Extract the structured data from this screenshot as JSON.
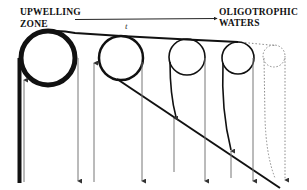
{
  "diagram": {
    "left_label": {
      "line1": "UPWELLING",
      "line2": "ZONE"
    },
    "right_label": {
      "line1": "OLIGOTROPHIC",
      "line2": "WATERS"
    },
    "time_label": "t",
    "colors": {
      "ink": "#111111",
      "flux_arrow": "#777777",
      "dotted": "#888888",
      "background": "#ffffff"
    },
    "circles": [
      {
        "id": "eddy-1",
        "cx": 48,
        "cy": 58,
        "r": 27,
        "stroke_width": 5
      },
      {
        "id": "eddy-2",
        "cx": 121,
        "cy": 58,
        "r": 22,
        "stroke_width": 2.5
      },
      {
        "id": "eddy-3",
        "cx": 187,
        "cy": 57,
        "r": 18,
        "stroke_width": 1.6
      },
      {
        "id": "eddy-4",
        "cx": 238,
        "cy": 58,
        "r": 16,
        "stroke_width": 1.6
      },
      {
        "id": "eddy-5-dotted",
        "cx": 274,
        "cy": 57,
        "r": 11,
        "dotted": true
      }
    ],
    "up_arrows_x": [
      24,
      94,
      176,
      231
    ],
    "down_arrows_x": [
      78,
      142,
      206,
      253,
      285
    ]
  }
}
